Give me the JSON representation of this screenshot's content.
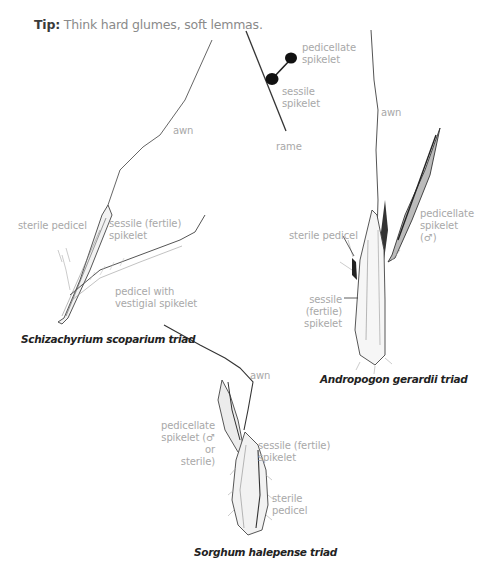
{
  "tip": {
    "prefix": "Tip:",
    "text": " Think hard glumes, soft lemmas."
  },
  "schematic": {
    "labels": {
      "pedicellate_1": "pedicellate",
      "pedicellate_2": "spikelet",
      "sessile_1": "sessile",
      "sessile_2": "spikelet",
      "rame": "rame"
    }
  },
  "schizachyrium": {
    "caption": "Schizachyrium scoparium triad",
    "labels": {
      "awn": "awn",
      "sterile_pedicel": "sterile pedicel",
      "sessile_1": "sessile (fertile)",
      "sessile_2": "spikelet",
      "pedicel_1": "pedicel with",
      "pedicel_2": "vestigial spikelet"
    }
  },
  "andropogon": {
    "caption": "Andropogon gerardii triad",
    "labels": {
      "awn": "awn",
      "sterile_pedicel": "sterile pedicel",
      "pedicellate_1": "pedicellate",
      "pedicellate_2": "spikelet",
      "pedicellate_3": "(♂)",
      "sessile_1": "sessile (fertile)",
      "sessile_2": "spikelet"
    }
  },
  "sorghum": {
    "caption": "Sorghum halepense triad",
    "labels": {
      "awn": "awn",
      "pedicellate_1": "pedicellate",
      "pedicellate_2": "spikelet (♂ or",
      "pedicellate_3": "sterile)",
      "sessile_1": "sessile (fertile)",
      "sessile_2": "spikelet",
      "sterile_1": "sterile",
      "sterile_2": "pedicel"
    }
  }
}
